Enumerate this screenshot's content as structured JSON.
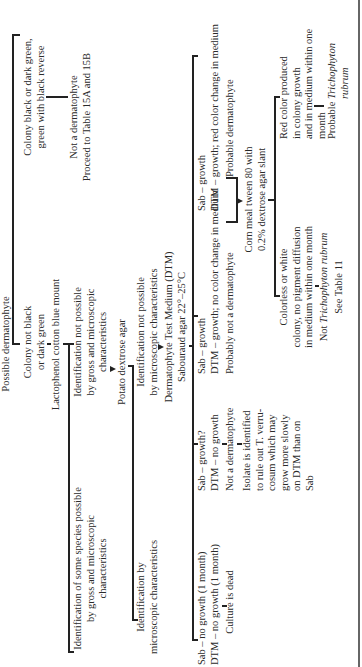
{
  "diagram": {
    "root": "Possible dermatophyte",
    "branch_black": {
      "condition": [
        "Colony black or dark green,",
        "green with black reverse"
      ],
      "result": [
        "Not a dermatophyte",
        "Proceed to Table 15A and 15B"
      ]
    },
    "branch_not_black": {
      "condition": [
        "Colony not black",
        "or dark green"
      ],
      "step": "Lactophenol cotton blue mount",
      "outcome_possible": [
        "Identification of some species possible",
        "by gross and microscopic",
        "characteristics"
      ],
      "outcome_not_possible": [
        "Identification not possible",
        "by gross and microscopic",
        "characteristics"
      ]
    },
    "potato": {
      "step": "Potato dextrose agar",
      "outcome_possible": [
        "Identification by",
        "microscopic characteristics"
      ],
      "outcome_not_possible": [
        "Identification not possible",
        "by microscopic characteristics"
      ]
    },
    "dtm": {
      "step": [
        "Dermatophyte Test Medium (DTM)",
        "Sabouraud agar 22°–25°C"
      ],
      "results": [
        {
          "lines": [
            "Sab – no growth (1 month)",
            "DTM – no growth (1 month)"
          ],
          "conclusion": "Culture is dead"
        },
        {
          "lines": [
            "Sab – growth?",
            "DTM – no growth"
          ],
          "conclusion": "Not a dermatophyte",
          "note": [
            "Isolate is identified",
            "to rule out T. verru-",
            "cosum which may",
            "grow more slowly",
            "on DTM than on",
            "Sab"
          ]
        },
        {
          "lines": [
            "Sab – growth",
            "DTM – growth; no color change in medium"
          ],
          "conclusion": "Probably not a dermatophyte"
        },
        {
          "lines": [
            "Sab – growth",
            "DTM – growth; red color change in medium"
          ],
          "conclusion": "Probable dermatophyte"
        }
      ]
    },
    "corn_meal": {
      "step": [
        "Corn meal tween 80 with",
        "0.2% dextrose agar slant"
      ],
      "colorless": {
        "condition": [
          "Colorless or white",
          "colony, no pigment diffusion",
          "in medium within one month"
        ],
        "result_prefix": "Not ",
        "result_species": "Trichophyton rubrum",
        "see": "See Table 11"
      },
      "red": {
        "condition": [
          "Red color produced",
          "in colony growth",
          "and in medium within one",
          "month"
        ],
        "result_prefix": "Probable ",
        "result_species_1": "Trichophyton",
        "result_species_2": "rubrum"
      }
    }
  }
}
